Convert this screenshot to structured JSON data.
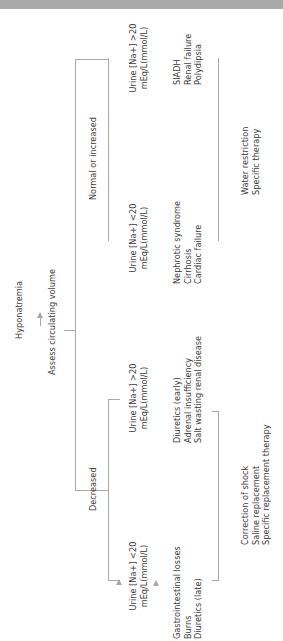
{
  "title": "Hyponatremia",
  "step1": "Assess circulating volume",
  "branches": {
    "decreased": {
      "label": "Decreased",
      "low": {
        "urine_line1": "Urine [Na+] <20",
        "urine_line2": "mEq/L(mmol/L)",
        "causes": [
          "Gastrointestinal losses",
          "Burns",
          "Diuretics (late)"
        ]
      },
      "high": {
        "urine_line1": "Urine [Na+] >20",
        "urine_line2": "mEq/L(mmol/L)",
        "causes": [
          "Diuretics (early)",
          "Adrenal insufficiency",
          "Salt wasting renal disease"
        ]
      },
      "treatment": [
        "Correction of shock",
        "Saline replacement",
        "Specific replacement therapy"
      ]
    },
    "normal": {
      "label": "Normal or increased",
      "low": {
        "urine_line1": "Urine [Na+] <20",
        "urine_line2": "mEq/L(mmol/L)",
        "causes": [
          "Nephrotic syndrome",
          "Cirrhosis",
          "Cardiac failure"
        ]
      },
      "high": {
        "urine_line1": "Urine [Na+] >20",
        "urine_line2": "mEq/L(mmol/L)",
        "causes": [
          "SIADH",
          "Renal failure",
          "Polydipsia"
        ]
      },
      "treatment": [
        "Water restriction",
        "Specific therapy"
      ]
    }
  },
  "colors": {
    "line": "#a8a8a8",
    "text": "#3a3a3a",
    "topbar": "#a9a9a9"
  }
}
